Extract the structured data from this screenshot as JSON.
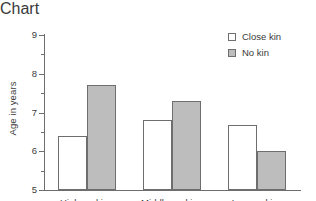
{
  "chart_data": {
    "type": "bar",
    "title": "",
    "xlabel": "",
    "ylabel": "Age in years",
    "categories": [
      "High ranking",
      "Middle ranking",
      "Low ranking"
    ],
    "series": [
      {
        "name": "Close kin",
        "values": [
          6.4,
          6.8,
          6.67
        ],
        "fill": "#ffffff"
      },
      {
        "name": "No kin",
        "values": [
          7.7,
          7.3,
          6.0
        ],
        "fill": "#bdbdbd"
      }
    ],
    "ylim": [
      5,
      9
    ],
    "y_major_ticks": [
      5,
      6,
      7,
      8,
      9
    ],
    "y_tick_labels": [
      "5",
      "6",
      "7",
      "8",
      "9"
    ],
    "y_minor_ticks": [
      5.5,
      6.5,
      7.5,
      8.5
    ],
    "grid": false,
    "legend_position": "top-right",
    "axis_color": "#6e6e6e",
    "text_color": "#3a3a3a",
    "background": "#ffffff"
  },
  "legend": {
    "entries": [
      {
        "label": "Close kin"
      },
      {
        "label": "No kin"
      }
    ]
  }
}
